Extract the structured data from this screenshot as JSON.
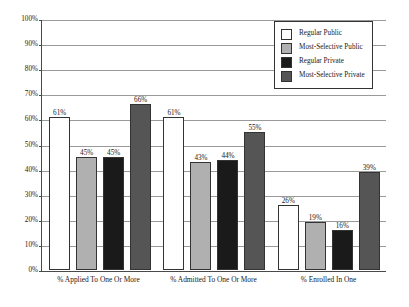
{
  "chart_data": {
    "type": "bar",
    "title": "",
    "subtitle": "",
    "xlabel": "",
    "ylabel": "",
    "ylim": [
      0,
      100
    ],
    "grid": true,
    "legend_position": "top-right-inside",
    "categories": [
      "% Applied To One Or More",
      "% Admitted To One Or More",
      "% Enrolled In One"
    ],
    "ytick_labels": [
      "100%",
      "90%",
      "80%",
      "70%",
      "60%",
      "50%",
      "40%",
      "30%",
      "20%",
      "10%",
      "0%"
    ],
    "ytick_values": [
      100,
      90,
      80,
      70,
      60,
      50,
      40,
      30,
      20,
      10,
      0
    ],
    "series": [
      {
        "name": "Regular Public",
        "color": "#ffffff",
        "values": [
          61,
          61,
          26
        ],
        "value_labels": [
          "61%",
          "61%",
          "26%"
        ]
      },
      {
        "name": "Most-Selective Public",
        "color": "#b0b0b0",
        "values": [
          45,
          43,
          19
        ],
        "value_labels": [
          "45%",
          "43%",
          "19%"
        ]
      },
      {
        "name": "Regular Private",
        "color": "#1a1a1a",
        "values": [
          45,
          44,
          16
        ],
        "value_labels": [
          "45%",
          "44%",
          "16%"
        ]
      },
      {
        "name": "Most-Selective Private",
        "color": "#555555",
        "values": [
          66,
          55,
          39
        ],
        "value_labels": [
          "66%",
          "55%",
          "39%"
        ]
      }
    ],
    "colors": {
      "regular_public": "#ffffff",
      "most_selective_public": "#b0b0b0",
      "regular_private": "#1a1a1a",
      "most_selective_private": "#555555",
      "gridline": "#9a9a9a",
      "axis": "#4a4a4a",
      "bar_outline": "#333333",
      "text": "#1a1a1a",
      "background": "#ffffff"
    }
  }
}
